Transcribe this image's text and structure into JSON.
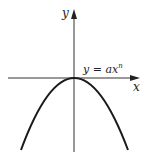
{
  "diagram": {
    "type": "function-graph",
    "axes": {
      "x_label": "x",
      "y_label": "y"
    },
    "curve": {
      "equation_prefix": "y = ax",
      "exponent": "n",
      "shape": "downward parabola with vertex at origin"
    },
    "colors": {
      "stroke": "#1a1a1a",
      "axis": "#333333",
      "background": "#ffffff"
    }
  }
}
